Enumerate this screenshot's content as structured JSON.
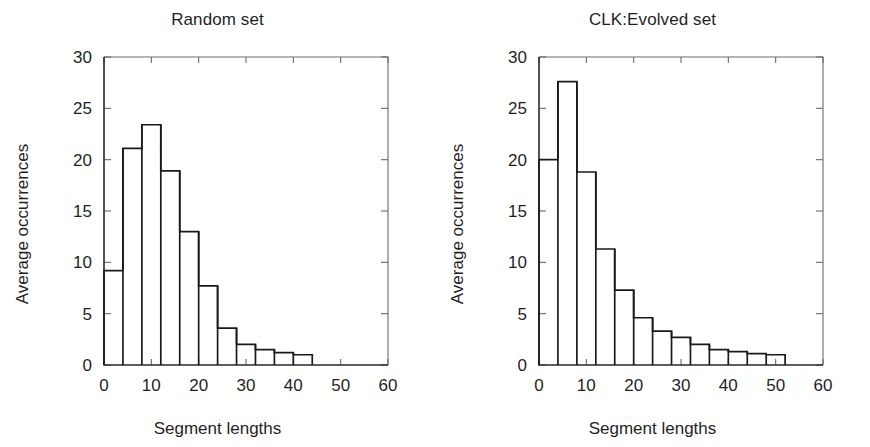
{
  "figure": {
    "width": 870,
    "height": 447,
    "background": "#ffffff",
    "ink_color": "#1a1a1a"
  },
  "shared": {
    "xlabel": "Segment lengths",
    "ylabel": "Average occurrences",
    "x_ticks": [
      "0",
      "10",
      "20",
      "30",
      "40",
      "50",
      "60"
    ],
    "y_ticks": [
      "0",
      "5",
      "10",
      "15",
      "20",
      "25",
      "30"
    ]
  },
  "chart_data": [
    {
      "type": "bar",
      "title": "Random set",
      "xlabel": "Segment lengths",
      "ylabel": "Average occurrences",
      "xlim": [
        0,
        60
      ],
      "ylim": [
        0,
        30
      ],
      "xticks": [
        0,
        10,
        20,
        30,
        40,
        50,
        60
      ],
      "yticks": [
        0,
        5,
        10,
        15,
        20,
        25,
        30
      ],
      "xtick_labels": [
        "0",
        "10",
        "20",
        "30",
        "40",
        "50",
        "60"
      ],
      "ytick_labels": [
        "0",
        "5",
        "10",
        "15",
        "20",
        "25",
        "30"
      ],
      "grid": false,
      "legend": false,
      "bin_width": 4,
      "bin_edges": [
        0,
        4,
        8,
        12,
        16,
        20,
        24,
        28,
        32,
        36,
        40,
        44
      ],
      "categories": [
        "0-4",
        "4-8",
        "8-12",
        "12-16",
        "16-20",
        "20-24",
        "24-28",
        "28-32",
        "32-36",
        "36-40",
        "40-44"
      ],
      "values": [
        9.2,
        21.1,
        23.4,
        18.9,
        13.0,
        7.7,
        3.6,
        2.0,
        1.5,
        1.2,
        1.0
      ]
    },
    {
      "type": "bar",
      "title": "CLK:Evolved set",
      "xlabel": "Segment lengths",
      "ylabel": "Average occurrences",
      "xlim": [
        0,
        60
      ],
      "ylim": [
        0,
        30
      ],
      "xticks": [
        0,
        10,
        20,
        30,
        40,
        50,
        60
      ],
      "yticks": [
        0,
        5,
        10,
        15,
        20,
        25,
        30
      ],
      "xtick_labels": [
        "0",
        "10",
        "20",
        "30",
        "40",
        "50",
        "60"
      ],
      "ytick_labels": [
        "0",
        "5",
        "10",
        "15",
        "20",
        "25",
        "30"
      ],
      "grid": false,
      "legend": false,
      "bin_width": 4,
      "bin_edges": [
        0,
        4,
        8,
        12,
        16,
        20,
        24,
        28,
        32,
        36,
        40,
        44,
        48,
        52
      ],
      "categories": [
        "0-4",
        "4-8",
        "8-12",
        "12-16",
        "16-20",
        "20-24",
        "24-28",
        "28-32",
        "32-36",
        "36-40",
        "40-44",
        "44-48",
        "48-52"
      ],
      "values": [
        20.0,
        27.6,
        18.8,
        11.3,
        7.3,
        4.6,
        3.3,
        2.7,
        2.0,
        1.5,
        1.3,
        1.1,
        1.0
      ]
    }
  ]
}
